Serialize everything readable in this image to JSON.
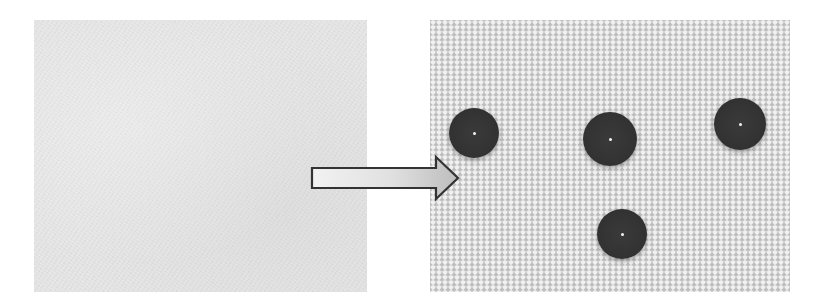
{
  "figure": {
    "panels": [
      {
        "id": "before",
        "description": "plain fabric swatch",
        "background_color": "#e3e3e3",
        "bbox": {
          "x": 34,
          "y": 20,
          "width": 333,
          "height": 272
        }
      },
      {
        "id": "after",
        "description": "woven fabric with water droplets beading on surface",
        "background_color": "#d4d4d4",
        "bbox": {
          "x": 430,
          "y": 20,
          "width": 360,
          "height": 272
        }
      }
    ],
    "arrow": {
      "direction": "right",
      "icon": "right-arrow-icon",
      "fill_start": "#f2f2f2",
      "fill_end": "#bdbdbd",
      "stroke": "#333333"
    },
    "droplets": [
      {
        "cx": 474,
        "cy": 133,
        "r": 25
      },
      {
        "cx": 610,
        "cy": 139,
        "r": 27
      },
      {
        "cx": 740,
        "cy": 124,
        "r": 26
      },
      {
        "cx": 622,
        "cy": 234,
        "r": 25
      }
    ],
    "droplet_color": "#333333",
    "droplet_count": 4
  }
}
